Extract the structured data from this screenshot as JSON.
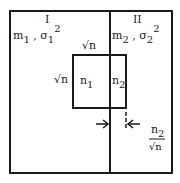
{
  "regions": {
    "left": {
      "label": "I",
      "mean": "m",
      "mean_sub": "1",
      "sep": ",",
      "var": "σ",
      "var_sub": "1",
      "var_sup": "2"
    },
    "right": {
      "label": "II",
      "mean": "m",
      "mean_sub": "2",
      "sep": ",",
      "var": "σ",
      "var_sub": "2",
      "var_sup": "2"
    }
  },
  "inner_square": {
    "side_top": "√n",
    "side_left": "√n",
    "left_part": {
      "n": "n",
      "sub": "1"
    },
    "right_part": {
      "n": "n",
      "sub": "2"
    }
  },
  "annotation": {
    "numerator": "n",
    "numerator_sub": "2",
    "denominator": "√n"
  }
}
